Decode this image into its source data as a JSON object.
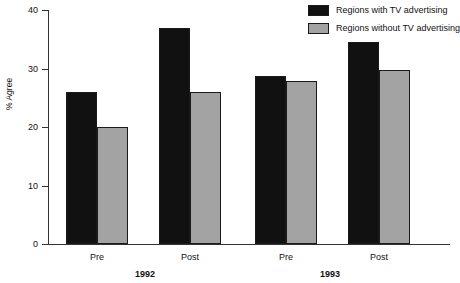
{
  "chart_data": {
    "type": "bar",
    "title": "",
    "xlabel": "",
    "ylabel": "% Agree",
    "ylim": [
      0,
      40
    ],
    "yticks": [
      0,
      10,
      20,
      30,
      40
    ],
    "grid": false,
    "legend_position": "top-right",
    "categories": [
      "Pre",
      "Post",
      "Pre",
      "Post"
    ],
    "groups": [
      {
        "name": "1992",
        "categories": [
          "Pre",
          "Post"
        ]
      },
      {
        "name": "1993",
        "categories": [
          "Pre",
          "Post"
        ]
      }
    ],
    "series": [
      {
        "name": "Regions with TV advertising",
        "color": "#111111",
        "values": [
          26.0,
          37.0,
          28.8,
          34.5
        ]
      },
      {
        "name": "Regions without TV advertising",
        "color": "#a3a3a3",
        "values": [
          20.0,
          26.0,
          27.8,
          29.7
        ]
      }
    ]
  },
  "legend": {
    "items": [
      {
        "label": "Regions with TV advertising",
        "color": "#111111"
      },
      {
        "label": "Regions without TV advertising",
        "color": "#a3a3a3"
      }
    ]
  },
  "axes": {
    "y_title": "% Agree",
    "y_ticks": [
      "0",
      "10",
      "20",
      "30",
      "40"
    ],
    "x_ticks": [
      "Pre",
      "Post",
      "Pre",
      "Post"
    ],
    "x_groups": [
      "1992",
      "1993"
    ]
  }
}
